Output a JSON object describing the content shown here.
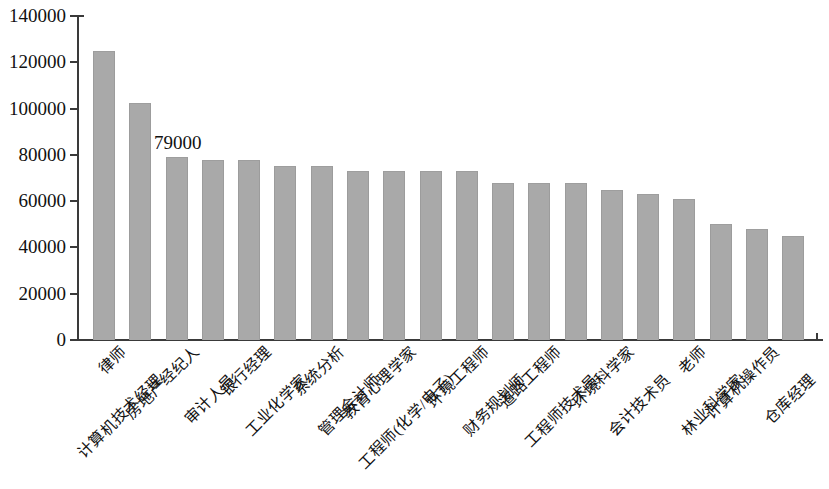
{
  "chart_data": {
    "type": "bar",
    "title": "",
    "subtitle": "",
    "xlabel": "",
    "ylabel": "",
    "grid": false,
    "legend": "none",
    "ylim": [
      0,
      140000
    ],
    "ytick_values": [
      0,
      20000,
      40000,
      60000,
      80000,
      100000,
      120000,
      140000
    ],
    "ytick_labels": [
      "0",
      "20000",
      "40000",
      "60000",
      "80000",
      "100000",
      "120000",
      "140000"
    ],
    "bar_color": "#a9a9a9",
    "background_color": "#ffffff",
    "axis_color": "#3a3a3a",
    "categories": [
      "律师",
      "计算机技术经理",
      "房地产经纪人",
      "审计人员",
      "银行经理",
      "工业化学家",
      "系统分析",
      "管理会计师",
      "教育心理学家",
      "工程师(化学/电子)",
      "环境工程师",
      "财务规划师",
      "道路工程师",
      "工程师技术员",
      "环境科学家",
      "会计技术员",
      "老师",
      "林业科学家",
      "计算机操作员",
      "仓库经理"
    ],
    "values": [
      125000,
      102500,
      79000,
      78000,
      78000,
      75000,
      75000,
      73000,
      73000,
      73000,
      73000,
      68000,
      68000,
      68000,
      65000,
      63000,
      61000,
      50000,
      48000,
      45000
    ],
    "annotations": [
      {
        "text": "79000",
        "category": "房地产经纪人",
        "value": 79000
      }
    ]
  }
}
